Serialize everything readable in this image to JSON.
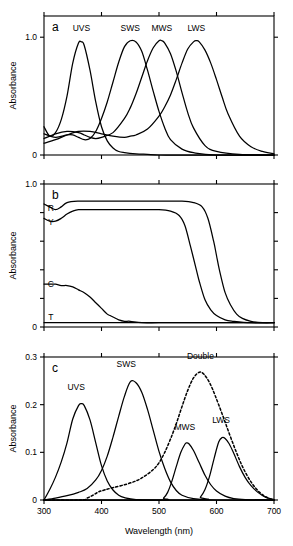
{
  "figure": {
    "xlabel": "Wavelength (nm)",
    "ylabel": "Absorbance",
    "xlim": [
      300,
      700
    ],
    "xticks": [
      300,
      400,
      500,
      600,
      700
    ],
    "xticklabels": [
      "300",
      "400",
      "500",
      "600",
      "700"
    ]
  },
  "panels": {
    "a": {
      "letter": "a",
      "ylabel": "Absorbance",
      "ylim": [
        0,
        1.18
      ],
      "yticks": [
        0,
        1.0
      ],
      "yticklabels": [
        "0",
        "1.0"
      ],
      "labels": {
        "uvs": "UVS",
        "sws": "SWS",
        "mws": "MWS",
        "lws": "LWS"
      }
    },
    "b": {
      "letter": "b",
      "ylabel": "Absorbance",
      "ylim": [
        0,
        1.0
      ],
      "yticks": [
        0,
        0.2,
        0.4,
        0.6,
        0.8,
        1.0
      ],
      "yticklabels": [
        "0",
        "",
        "",
        "",
        "",
        "1.0"
      ],
      "labels": {
        "r": "R",
        "y": "Y",
        "c": "C",
        "t": "T"
      }
    },
    "c": {
      "letter": "c",
      "ylabel": "Absorbance",
      "ylim": [
        0,
        0.3
      ],
      "yticks": [
        0,
        0.1,
        0.2,
        0.3
      ],
      "yticklabels": [
        "0",
        "0.1",
        "0.2",
        "0.3"
      ],
      "labels": {
        "uvs": "UVS",
        "sws": "SWS",
        "mws": "MWS",
        "lws": "LWS",
        "double": "Double"
      }
    }
  },
  "chart_data": [
    {
      "type": "line",
      "panel": "a",
      "title": "Visual pigment absorbance spectra",
      "xlabel": "Wavelength (nm)",
      "ylabel": "Absorbance",
      "xlim": [
        300,
        700
      ],
      "ylim": [
        0,
        1.18
      ],
      "grid": false,
      "legend": "inline-labels",
      "series": [
        {
          "name": "UVS",
          "peak_nm": 365,
          "peak_value": 0.96,
          "x": [
            300,
            310,
            320,
            330,
            340,
            350,
            360,
            365,
            370,
            380,
            390,
            400,
            410,
            420,
            430,
            440,
            460,
            480,
            500,
            540,
            600,
            700
          ],
          "values": [
            0.24,
            0.16,
            0.19,
            0.3,
            0.5,
            0.78,
            0.95,
            0.96,
            0.93,
            0.72,
            0.45,
            0.24,
            0.12,
            0.06,
            0.03,
            0.02,
            0.01,
            0.005,
            0.0,
            0.0,
            0.0,
            0.0
          ]
        },
        {
          "name": "SWS",
          "peak_nm": 450,
          "peak_value": 0.97,
          "x": [
            300,
            320,
            340,
            350,
            360,
            370,
            380,
            390,
            400,
            410,
            420,
            430,
            440,
            450,
            460,
            470,
            480,
            490,
            500,
            510,
            520,
            540,
            560,
            600,
            700
          ],
          "values": [
            0.18,
            0.15,
            0.17,
            0.17,
            0.15,
            0.13,
            0.14,
            0.2,
            0.31,
            0.45,
            0.62,
            0.79,
            0.92,
            0.97,
            0.96,
            0.88,
            0.72,
            0.54,
            0.37,
            0.23,
            0.13,
            0.05,
            0.02,
            0.0,
            0.0
          ]
        },
        {
          "name": "MWS",
          "peak_nm": 505,
          "peak_value": 0.97,
          "x": [
            300,
            320,
            340,
            360,
            370,
            380,
            390,
            400,
            420,
            440,
            450,
            460,
            470,
            480,
            490,
            500,
            505,
            510,
            520,
            530,
            540,
            550,
            560,
            580,
            600,
            640,
            700
          ],
          "values": [
            0.14,
            0.18,
            0.2,
            0.19,
            0.17,
            0.15,
            0.14,
            0.15,
            0.19,
            0.31,
            0.4,
            0.52,
            0.66,
            0.8,
            0.91,
            0.97,
            0.97,
            0.95,
            0.86,
            0.71,
            0.53,
            0.36,
            0.23,
            0.08,
            0.03,
            0.005,
            0.0
          ]
        },
        {
          "name": "LWS",
          "peak_nm": 565,
          "peak_value": 0.97,
          "x": [
            300,
            320,
            340,
            360,
            380,
            400,
            420,
            440,
            450,
            460,
            480,
            500,
            510,
            520,
            530,
            540,
            550,
            560,
            565,
            570,
            580,
            590,
            600,
            610,
            620,
            640,
            660,
            680,
            700
          ],
          "values": [
            0.1,
            0.13,
            0.17,
            0.2,
            0.2,
            0.18,
            0.16,
            0.15,
            0.16,
            0.17,
            0.22,
            0.33,
            0.41,
            0.51,
            0.64,
            0.78,
            0.9,
            0.96,
            0.97,
            0.96,
            0.89,
            0.78,
            0.64,
            0.49,
            0.35,
            0.16,
            0.07,
            0.03,
            0.01
          ]
        }
      ]
    },
    {
      "type": "line",
      "panel": "b",
      "title": "Oil droplet transmittance/absorbance",
      "xlabel": "Wavelength (nm)",
      "ylabel": "Absorbance",
      "xlim": [
        300,
        700
      ],
      "ylim": [
        0,
        1.0
      ],
      "grid": false,
      "legend": "inline-labels",
      "series": [
        {
          "name": "R",
          "cutoff_nm": 600,
          "plateau": 0.88,
          "x": [
            300,
            310,
            320,
            330,
            340,
            360,
            380,
            420,
            460,
            500,
            540,
            560,
            575,
            585,
            595,
            600,
            605,
            615,
            625,
            635,
            645,
            660,
            680,
            700
          ],
          "values": [
            0.86,
            0.84,
            0.82,
            0.84,
            0.87,
            0.88,
            0.88,
            0.88,
            0.88,
            0.88,
            0.88,
            0.87,
            0.84,
            0.76,
            0.6,
            0.5,
            0.4,
            0.24,
            0.15,
            0.09,
            0.06,
            0.04,
            0.03,
            0.03
          ]
        },
        {
          "name": "Y",
          "cutoff_nm": 565,
          "plateau": 0.82,
          "x": [
            300,
            310,
            320,
            330,
            340,
            350,
            360,
            380,
            420,
            460,
            500,
            520,
            535,
            545,
            555,
            565,
            570,
            580,
            590,
            600,
            615,
            630,
            660,
            700
          ],
          "values": [
            0.76,
            0.74,
            0.74,
            0.76,
            0.79,
            0.81,
            0.82,
            0.82,
            0.82,
            0.82,
            0.82,
            0.81,
            0.78,
            0.71,
            0.56,
            0.4,
            0.32,
            0.19,
            0.12,
            0.08,
            0.05,
            0.04,
            0.03,
            0.03
          ]
        },
        {
          "name": "C",
          "cutoff_nm": 415,
          "plateau": 0.3,
          "x": [
            300,
            310,
            320,
            330,
            340,
            350,
            360,
            370,
            380,
            390,
            400,
            410,
            415,
            420,
            430,
            440,
            450,
            470,
            500,
            550,
            600,
            700
          ],
          "values": [
            0.3,
            0.3,
            0.3,
            0.29,
            0.29,
            0.28,
            0.26,
            0.24,
            0.21,
            0.17,
            0.13,
            0.09,
            0.08,
            0.07,
            0.05,
            0.04,
            0.04,
            0.03,
            0.03,
            0.03,
            0.03,
            0.03
          ]
        },
        {
          "name": "T",
          "cutoff_nm": null,
          "plateau": 0.03,
          "x": [
            300,
            400,
            500,
            600,
            700
          ],
          "values": [
            0.03,
            0.03,
            0.03,
            0.03,
            0.03
          ]
        }
      ]
    },
    {
      "type": "line",
      "panel": "c",
      "title": "Effective cone absorbance (pigment x oil droplet)",
      "xlabel": "Wavelength (nm)",
      "ylabel": "Absorbance",
      "xlim": [
        300,
        700
      ],
      "ylim": [
        0,
        0.3
      ],
      "grid": false,
      "legend": "inline-labels",
      "series": [
        {
          "name": "UVS",
          "style": "solid",
          "peak_nm": 365,
          "peak_value": 0.202,
          "x": [
            300,
            310,
            320,
            330,
            340,
            350,
            360,
            365,
            370,
            380,
            390,
            400,
            410,
            420,
            430,
            440,
            460,
            500,
            700
          ],
          "values": [
            0.0,
            0.022,
            0.048,
            0.08,
            0.12,
            0.17,
            0.198,
            0.202,
            0.198,
            0.168,
            0.12,
            0.072,
            0.04,
            0.021,
            0.01,
            0.005,
            0.001,
            0.0,
            0.0
          ]
        },
        {
          "name": "SWS",
          "style": "solid",
          "peak_nm": 450,
          "peak_value": 0.248,
          "x": [
            300,
            320,
            340,
            360,
            375,
            390,
            400,
            410,
            420,
            430,
            440,
            450,
            460,
            470,
            480,
            490,
            500,
            510,
            520,
            530,
            540,
            560,
            600,
            700
          ],
          "values": [
            0.0,
            0.004,
            0.009,
            0.016,
            0.024,
            0.042,
            0.062,
            0.092,
            0.132,
            0.176,
            0.218,
            0.248,
            0.246,
            0.226,
            0.19,
            0.146,
            0.102,
            0.066,
            0.038,
            0.02,
            0.01,
            0.003,
            0.0,
            0.0
          ]
        },
        {
          "name": "MWS",
          "style": "solid",
          "peak_nm": 548,
          "peak_value": 0.12,
          "x": [
            300,
            500,
            508,
            515,
            522,
            530,
            538,
            545,
            548,
            552,
            560,
            570,
            580,
            590,
            600,
            615,
            630,
            650,
            700
          ],
          "values": [
            0.0,
            0.0,
            0.004,
            0.016,
            0.038,
            0.07,
            0.1,
            0.117,
            0.12,
            0.118,
            0.104,
            0.078,
            0.052,
            0.032,
            0.019,
            0.008,
            0.003,
            0.001,
            0.0
          ]
        },
        {
          "name": "LWS",
          "style": "solid",
          "peak_nm": 610,
          "peak_value": 0.131,
          "x": [
            300,
            565,
            572,
            580,
            588,
            596,
            604,
            610,
            615,
            622,
            630,
            640,
            650,
            660,
            672,
            685,
            700
          ],
          "values": [
            0.0,
            0.0,
            0.006,
            0.022,
            0.05,
            0.088,
            0.122,
            0.131,
            0.129,
            0.118,
            0.098,
            0.07,
            0.047,
            0.03,
            0.016,
            0.006,
            0.001
          ]
        },
        {
          "name": "Double",
          "style": "dashed",
          "peak_nm": 570,
          "peak_value": 0.268,
          "x": [
            300,
            365,
            375,
            385,
            395,
            405,
            420,
            440,
            460,
            475,
            490,
            500,
            510,
            520,
            530,
            540,
            550,
            560,
            570,
            578,
            588,
            598,
            610,
            622,
            634,
            646,
            660,
            675,
            690,
            700
          ],
          "values": [
            0.0,
            0.0,
            0.004,
            0.01,
            0.017,
            0.021,
            0.026,
            0.032,
            0.04,
            0.05,
            0.064,
            0.078,
            0.1,
            0.128,
            0.16,
            0.196,
            0.23,
            0.256,
            0.268,
            0.264,
            0.246,
            0.218,
            0.18,
            0.14,
            0.102,
            0.068,
            0.038,
            0.016,
            0.004,
            0.0
          ]
        }
      ]
    }
  ]
}
